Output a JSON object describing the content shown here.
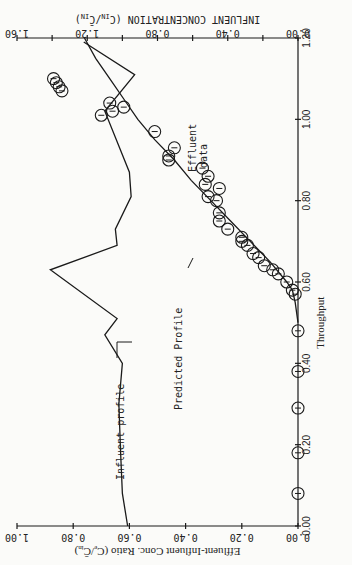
{
  "chart_data": {
    "type": "line",
    "orientation": "rotated 90 degrees clockwise",
    "title": "",
    "xlabel": "Throughput",
    "ylabel": "Effluent-Influent Conc. Ratio (C_e/C̄_in)",
    "y2label": "INFLUENT CONCENTRATION (CIN/C̄IN)",
    "xlim": [
      0.0,
      1.2
    ],
    "ylim": [
      0.0,
      1.0
    ],
    "y2lim": [
      0.0,
      1.6
    ],
    "x_ticks": [
      "0.00",
      "0.20",
      "0.40",
      "0.60",
      "0.80",
      "1.00",
      "1.20"
    ],
    "y_ticks": [
      "0.00",
      "0.20",
      "0.40",
      "0.60",
      "0.80",
      "1.00"
    ],
    "y2_ticks": [
      "0.00",
      "0.40",
      "0.80",
      "1.20",
      "1.60"
    ],
    "grid": false,
    "annotations": [
      "Effluent data",
      "Predicted Profile",
      "Influent profile"
    ],
    "series": [
      {
        "name": "Effluent data",
        "type": "scatter",
        "marker": "circle",
        "x": [
          0.08,
          0.18,
          0.29,
          0.38,
          0.48,
          0.57,
          0.58,
          0.6,
          0.62,
          0.63,
          0.64,
          0.66,
          0.67,
          0.69,
          0.7,
          0.71,
          0.73,
          0.75,
          0.77,
          0.8,
          0.81,
          0.83,
          0.84,
          0.86,
          0.88,
          0.9,
          0.91,
          0.93,
          0.97,
          1.01,
          1.02,
          1.03,
          1.04,
          1.07,
          1.08,
          1.09,
          1.1
        ],
        "y": [
          0.0,
          0.0,
          0.0,
          0.0,
          0.0,
          0.01,
          0.02,
          0.04,
          0.07,
          0.09,
          0.12,
          0.14,
          0.16,
          0.18,
          0.2,
          0.2,
          0.25,
          0.28,
          0.28,
          0.29,
          0.32,
          0.28,
          0.33,
          0.32,
          0.34,
          0.46,
          0.46,
          0.44,
          0.51,
          0.7,
          0.66,
          0.62,
          0.67,
          0.84,
          0.85,
          0.86,
          0.87
        ]
      },
      {
        "name": "Predicted Profile",
        "type": "line",
        "x": [
          0.5,
          0.55,
          0.58,
          0.6,
          0.65,
          0.7,
          0.75,
          0.8,
          0.85,
          0.9,
          0.95,
          1.0,
          1.05,
          1.1,
          1.15,
          1.2
        ],
        "y": [
          0.0,
          0.01,
          0.02,
          0.04,
          0.1,
          0.17,
          0.24,
          0.31,
          0.38,
          0.44,
          0.51,
          0.57,
          0.62,
          0.67,
          0.72,
          0.76
        ]
      },
      {
        "name": "Influent profile",
        "type": "line",
        "axis": "y2",
        "x": [
          0.0,
          0.08,
          0.18,
          0.3,
          0.4,
          0.47,
          0.51,
          0.63,
          0.69,
          0.73,
          0.81,
          0.87,
          1.02,
          1.11,
          1.19
        ],
        "y2": [
          0.97,
          1.0,
          1.01,
          1.02,
          1.0,
          1.1,
          1.03,
          1.41,
          1.03,
          1.04,
          0.95,
          0.96,
          1.1,
          0.93,
          1.22
        ]
      }
    ]
  },
  "labels": {
    "xlabel": "Throughput",
    "ylabel": "Effluent-Influent Conc. Ratio (C",
    "ylabel_sub1": "e",
    "ylabel_mid": "/C̄",
    "ylabel_sub2": "in",
    "ylabel_end": ")",
    "y2label": "INFLUENT CONCENTRATION (C",
    "y2label_sub1": "IN",
    "y2label_mid": "/C̄",
    "y2label_sub2": "IN",
    "y2label_end": ")",
    "effluent_annot_1": "Effluent",
    "effluent_annot_2": "data",
    "predicted_annot": "Predicted Profile",
    "influent_annot": "Influent profile"
  }
}
